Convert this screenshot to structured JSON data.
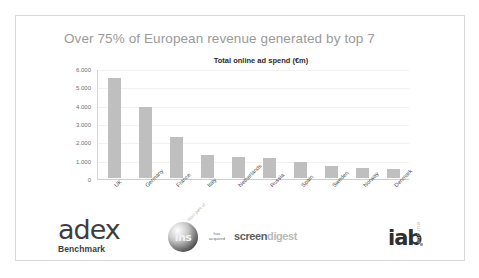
{
  "slide": {
    "title": "Over 75% of European revenue generated by top 7"
  },
  "chart_data": {
    "type": "bar",
    "title": "Total online ad spend (€m)",
    "xlabel": "",
    "ylabel": "",
    "categories": [
      "UK",
      "Germany",
      "France",
      "Italy",
      "Netherlands",
      "Russia",
      "Spain",
      "Sweden",
      "Norway",
      "Denmark"
    ],
    "values": [
      5450,
      3900,
      2250,
      1230,
      1160,
      1100,
      890,
      640,
      520,
      480
    ],
    "ylim": [
      0,
      6000
    ],
    "yticks": [
      6000,
      5000,
      4000,
      3000,
      2000,
      1000,
      0
    ],
    "ytick_labels": [
      "6.000",
      "5.000",
      "4.000",
      "3.000",
      "2.000",
      "1.000",
      "0"
    ],
    "grid": true,
    "legend": false,
    "bar_color": "#bfbfbf"
  },
  "logos": {
    "adex": {
      "word": "adex",
      "sub": "Benchmark"
    },
    "ihs": {
      "mark": "ihs",
      "note": "Now part of",
      "acquired": "has acquired",
      "screen": "screen",
      "digest": "digest"
    },
    "iab": {
      "word": "iab",
      "region": "europe"
    }
  }
}
